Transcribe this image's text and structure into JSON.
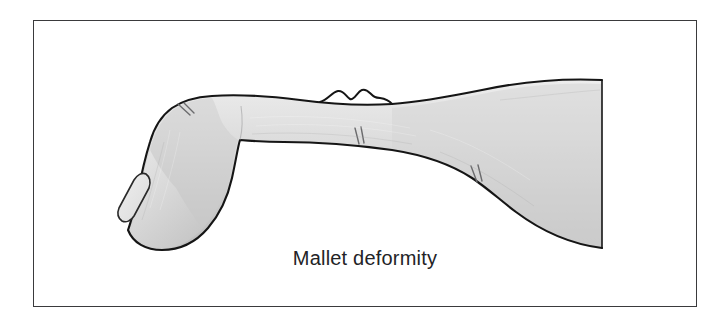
{
  "figure": {
    "caption": "Mallet deformity",
    "frame": {
      "x": 33,
      "y": 20,
      "width": 664,
      "height": 287,
      "border_color": "#3a3a3c",
      "background_color": "#ffffff"
    },
    "illustration": {
      "title": "Mallet deformity",
      "subject": "side view of a hand and index finger with drooping distal phalanx",
      "style": "line drawing with gray gradient shading",
      "outline_color": "#1a1a1a",
      "fill_light": "#e8e8e8",
      "fill_mid": "#d2d2d2",
      "fill_dark": "#b5b5b5",
      "nail_fill": "#e4e4e4",
      "crease_color": "#6e6e70",
      "parts": [
        {
          "name": "hand-dorsum",
          "label": "dorsum of hand"
        },
        {
          "name": "proximal-phalanx",
          "label": "proximal phalanx"
        },
        {
          "name": "middle-phalanx",
          "label": "middle phalanx"
        },
        {
          "name": "distal-phalanx-drooped",
          "label": "drooped distal phalanx"
        },
        {
          "name": "fingernail",
          "label": "fingernail"
        },
        {
          "name": "mcp-knuckle-bumps",
          "label": "knuckle skin folds"
        },
        {
          "name": "dip-crease",
          "label": "DIP skin crease"
        },
        {
          "name": "pip-crease",
          "label": "PIP skin crease"
        },
        {
          "name": "mcp-crease",
          "label": "MCP skin crease"
        }
      ]
    }
  }
}
